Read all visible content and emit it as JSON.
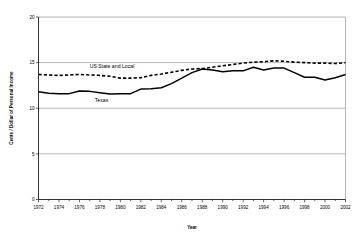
{
  "chart_data": {
    "type": "line",
    "title": "",
    "xlabel": "Year",
    "ylabel": "Cents / Dollar of Personal Income",
    "xlim": [
      1972,
      2002
    ],
    "ylim": [
      0,
      20
    ],
    "ytick_labels": [
      "20",
      "15",
      "10",
      "5",
      "0"
    ],
    "yticks": [
      20,
      15,
      10,
      5,
      0
    ],
    "xtick_labels": [
      "1972",
      "1974",
      "1976",
      "1978",
      "1980",
      "1982",
      "1984",
      "1986",
      "1988",
      "1990",
      "1992",
      "1994",
      "1996",
      "1998",
      "2000",
      "2002"
    ],
    "xticks": [
      1972,
      1974,
      1976,
      1978,
      1980,
      1982,
      1984,
      1986,
      1988,
      1990,
      1992,
      1994,
      1996,
      1998,
      2000,
      2002
    ],
    "grid": "horizontal",
    "legend_position": "inline-annotation",
    "x": [
      1972,
      1973,
      1974,
      1975,
      1976,
      1977,
      1978,
      1979,
      1980,
      1981,
      1982,
      1983,
      1984,
      1985,
      1986,
      1987,
      1988,
      1989,
      1990,
      1991,
      1992,
      1993,
      1994,
      1995,
      1996,
      1997,
      1998,
      1999,
      2000,
      2001,
      2002
    ],
    "series": [
      {
        "name": "US State and Local",
        "style": "dashed",
        "color": "#000000",
        "values": [
          13.7,
          13.65,
          13.6,
          13.65,
          13.7,
          13.65,
          13.6,
          13.5,
          13.3,
          13.3,
          13.35,
          13.6,
          13.75,
          13.95,
          14.15,
          14.3,
          14.35,
          14.5,
          14.65,
          14.8,
          14.95,
          15.05,
          15.1,
          15.2,
          15.15,
          15.05,
          15.0,
          14.95,
          14.95,
          14.9,
          15.0
        ]
      },
      {
        "name": "Texas",
        "style": "solid",
        "color": "#000000",
        "values": [
          11.8,
          11.65,
          11.6,
          11.6,
          11.9,
          11.85,
          11.7,
          11.55,
          11.6,
          11.6,
          12.1,
          12.15,
          12.25,
          12.7,
          13.3,
          13.9,
          14.3,
          14.2,
          14.0,
          14.1,
          14.1,
          14.5,
          14.2,
          14.4,
          14.4,
          13.9,
          13.4,
          13.4,
          13.1,
          13.35,
          13.7
        ]
      }
    ],
    "annotations": [
      {
        "name": "us-state-local-label",
        "text": "US State and Local",
        "x": 1977.0,
        "y": 14.45
      },
      {
        "name": "texas-label",
        "text": "Texas",
        "x": 1977.5,
        "y": 10.65
      }
    ]
  }
}
